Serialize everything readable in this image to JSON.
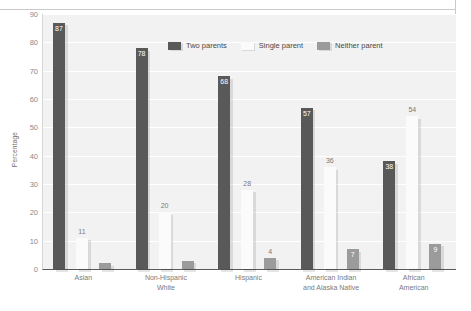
{
  "chart_data": {
    "type": "bar",
    "title": "",
    "xlabel": "",
    "ylabel": "Percentage",
    "ylim": [
      0,
      90
    ],
    "ytick_step": 10,
    "yticks": [
      90,
      80,
      70,
      60,
      50,
      40,
      30,
      20,
      10,
      0
    ],
    "grid": true,
    "legend_position": "top-center",
    "categories": [
      "Asian",
      "Non-Hispanic White",
      "Hispanic",
      "American Indian and Alaska Native",
      "African American"
    ],
    "category_lines": [
      [
        "Asian"
      ],
      [
        "Non-Hispanic",
        "White"
      ],
      [
        "Hispanic"
      ],
      [
        "American Indian",
        "and Alaska Native"
      ],
      [
        "African",
        "American"
      ]
    ],
    "series": [
      {
        "name": "Two parents",
        "color": "#595959",
        "values": [
          87,
          78,
          68,
          57,
          38
        ],
        "labels": [
          "87",
          "78",
          "68",
          "57",
          "38"
        ]
      },
      {
        "name": "Single parent",
        "color": "#fbfbfb",
        "values": [
          11,
          20,
          28,
          36,
          54
        ],
        "labels": [
          "11",
          "20",
          "28",
          "36",
          "54"
        ]
      },
      {
        "name": "Neither parent",
        "color": "#9b9b9b",
        "values": [
          2,
          3,
          4,
          7,
          9
        ],
        "labels": [
          "",
          "",
          "4",
          "7",
          "9"
        ]
      }
    ]
  },
  "legend": {
    "items": [
      {
        "label": "Two parents"
      },
      {
        "label": "Single parent"
      },
      {
        "label": "Neither parent"
      }
    ]
  },
  "axis": {
    "y_title": "Percentage"
  },
  "colors": {
    "two_parents": "#595959",
    "single_parent": "#fbfbfb",
    "neither_parent": "#9b9b9b",
    "plot_background": "#f2f2f2",
    "gridline": "#ffffff",
    "axis_line": "#5a5a5a",
    "tick_text": "#8a8a8a",
    "label_text": "#7a7a7a"
  }
}
